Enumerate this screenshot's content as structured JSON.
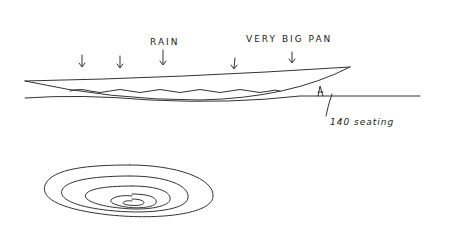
{
  "labels": {
    "rain": "RAIN",
    "pan": "VERY BIG PAN",
    "seating": "140 seating"
  },
  "colors": {
    "ink": "#333333",
    "paper": "#ffffff"
  }
}
